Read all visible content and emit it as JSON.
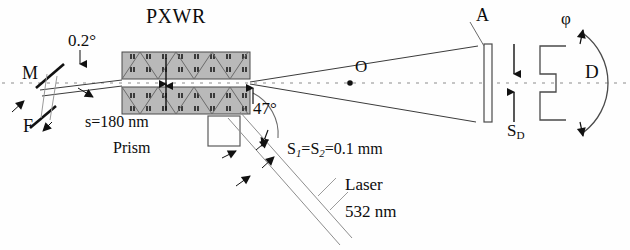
{
  "figure": {
    "background_color": "#ffffff",
    "ink_color": "#111111",
    "block_fill_color": "#b9b9b9",
    "block_edge_color": "#4a4a4a"
  },
  "labels": {
    "pxwr": "PXWR",
    "incidence_angle": "0.2°",
    "mirror": "M",
    "filter": "F",
    "slit_width": "s=180 nm",
    "slit_width_symbol": "s",
    "slit_width_value": "=180 nm",
    "prism": "Prism",
    "prism_angle": "47°",
    "slits_symbol_1": "S",
    "slits_sub_1": "1",
    "slits_eq_1": "=",
    "slits_symbol_2": "S",
    "slits_sub_2": "2",
    "slits_value": "=0.1 mm",
    "slits_full": "S1=S2=0.1 mm",
    "laser": "Laser",
    "wavelength": "532 nm",
    "center_point": "O",
    "aperture": "A",
    "detector_slit_symbol": "S",
    "detector_slit_sub": "D",
    "detector_slit_full": "SD",
    "detector": "D",
    "rotation_angle": "φ"
  },
  "components": {
    "mirror": {
      "name": "M",
      "role": "steering mirror"
    },
    "filter": {
      "name": "F",
      "role": "filter"
    },
    "pxwr": {
      "name": "PXWR",
      "role": "planar x-ray waveguide resonator",
      "gap_nm": 180
    },
    "prism": {
      "name": "Prism",
      "angle_deg": 47
    },
    "slits": {
      "s1_mm": 0.1,
      "s2_mm": 0.1
    },
    "laser": {
      "wavelength_nm": 532
    },
    "aperture": {
      "name": "A"
    },
    "detector_slit": {
      "name": "SD"
    },
    "detector": {
      "name": "D",
      "rotation_symbol": "φ"
    },
    "axis_point": {
      "name": "O"
    }
  }
}
